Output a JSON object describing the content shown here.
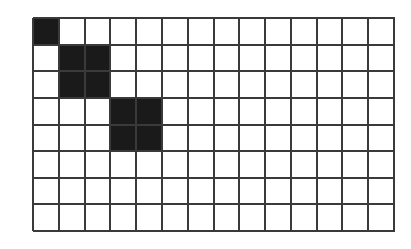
{
  "diagram": {
    "type": "grid",
    "columns": 14,
    "rows": 8,
    "line_color": "#3a3a3a",
    "fill_color": "#1a1a1a",
    "background": "#ffffff",
    "filled_blocks": [
      {
        "col": 0,
        "row": 0,
        "width": 1,
        "height": 1
      },
      {
        "col": 1,
        "row": 1,
        "width": 2,
        "height": 2
      },
      {
        "col": 3,
        "row": 3,
        "width": 2,
        "height": 2
      }
    ]
  }
}
